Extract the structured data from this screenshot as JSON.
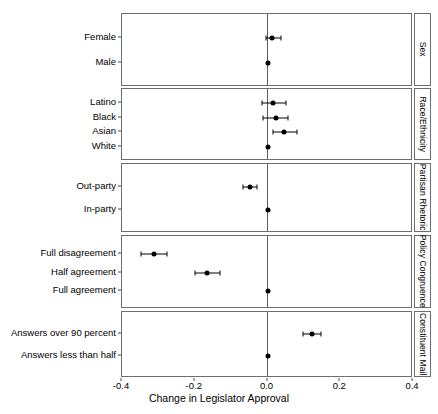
{
  "chart_data": {
    "type": "scatter",
    "title": "",
    "subtitle": "",
    "xlabel": "Change in Legislator Approval",
    "ylabel": "",
    "xlim": [
      -0.4,
      0.4
    ],
    "xticks": [
      -0.4,
      -0.2,
      0.0,
      0.2,
      0.4
    ],
    "xticklabels": [
      "-0.4",
      "-0.2",
      "0.0",
      "0.2",
      "0.4"
    ],
    "grid": false,
    "legend": "none",
    "reference_line_x": 0.0,
    "marker": "filled-circle-with-horizontal-error-bars",
    "facet_strip_position": "right",
    "orientation": "horizontal",
    "panels": [
      {
        "strip_label": "Sex",
        "categories": [
          "Female",
          "Male"
        ],
        "points": [
          {
            "label": "Female",
            "value": 0.011,
            "ci_low": -0.004,
            "ci_high": 0.038,
            "reference": false
          },
          {
            "label": "Male",
            "value": 0.0,
            "ci_low": 0.0,
            "ci_high": 0.0,
            "reference": true
          }
        ]
      },
      {
        "strip_label": "Race/Ethnicity",
        "categories": [
          "Latino",
          "Black",
          "Asian",
          "White"
        ],
        "points": [
          {
            "label": "Latino",
            "value": 0.016,
            "ci_low": -0.014,
            "ci_high": 0.052,
            "reference": false
          },
          {
            "label": "Black",
            "value": 0.022,
            "ci_low": -0.012,
            "ci_high": 0.056,
            "reference": false
          },
          {
            "label": "Asian",
            "value": 0.046,
            "ci_low": 0.014,
            "ci_high": 0.082,
            "reference": false
          },
          {
            "label": "White",
            "value": 0.0,
            "ci_low": 0.0,
            "ci_high": 0.0,
            "reference": true
          }
        ]
      },
      {
        "strip_label": "Partisan Rhetoric",
        "categories": [
          "Out-party",
          "In-party"
        ],
        "points": [
          {
            "label": "Out-party",
            "value": -0.049,
            "ci_low": -0.068,
            "ci_high": -0.028,
            "reference": false
          },
          {
            "label": "In-party",
            "value": 0.0,
            "ci_low": 0.0,
            "ci_high": 0.0,
            "reference": true
          }
        ]
      },
      {
        "strip_label": "Policy Congruence",
        "categories": [
          "Full disagreement",
          "Half agreement",
          "Full agreement"
        ],
        "points": [
          {
            "label": "Full disagreement",
            "value": -0.312,
            "ci_low": -0.347,
            "ci_high": -0.275,
            "reference": false
          },
          {
            "label": "Half agreement",
            "value": -0.165,
            "ci_low": -0.198,
            "ci_high": -0.131,
            "reference": false
          },
          {
            "label": "Full agreement",
            "value": 0.0,
            "ci_low": 0.0,
            "ci_high": 0.0,
            "reference": true
          }
        ]
      },
      {
        "strip_label": "Constituent Mail",
        "categories": [
          "Answers over 90 percent",
          "Answers less than half"
        ],
        "points": [
          {
            "label": "Answers over 90 percent",
            "value": 0.122,
            "ci_low": 0.098,
            "ci_high": 0.148,
            "reference": false
          },
          {
            "label": "Answers less than half",
            "value": 0.0,
            "ci_low": 0.0,
            "ci_high": 0.0,
            "reference": true
          }
        ]
      }
    ]
  },
  "layout": {
    "plot_left": 121,
    "plot_right": 412,
    "strip_left": 414,
    "strip_right": 431,
    "panel_tops": [
      13,
      88,
      163,
      235,
      311
    ],
    "panel_bottoms": [
      86,
      160,
      232,
      308,
      377
    ],
    "axis_label_y": 393,
    "tick_label_y": 381
  },
  "colors": {
    "point": "#000000",
    "errorbar": "#000000",
    "zero_line": "#5a5a5a",
    "panel_border": "#6e6e6e",
    "text": "#000000",
    "background": "#ffffff"
  }
}
